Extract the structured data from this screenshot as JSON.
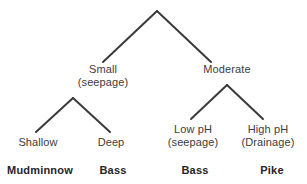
{
  "diagram": {
    "type": "decision-tree",
    "title": "",
    "background_color": "#ffffff",
    "edge_color": "#3a3a3a",
    "label_color": "#3c3c3c",
    "leaf_color": "#262626",
    "root": {
      "label": "",
      "children": [
        {
          "label_line1": "Small",
          "label_line2": "(seepage)",
          "children": [
            {
              "label_line1": "Shallow",
              "label_line2": "",
              "leaf": "Mudminnow"
            },
            {
              "label_line1": "Deep",
              "label_line2": "",
              "leaf": "Bass"
            }
          ]
        },
        {
          "label_line1": "Moderate",
          "label_line2": "",
          "children": [
            {
              "label_line1": "Low pH",
              "label_line2": "(seepage)",
              "leaf": "Bass"
            },
            {
              "label_line1": "High pH",
              "label_line2": "(Drainage)",
              "leaf": "Pike"
            }
          ]
        }
      ]
    },
    "nodes": {
      "small": {
        "line1": "Small",
        "line2": "(seepage)"
      },
      "moderate": {
        "line1": "Moderate",
        "line2": ""
      },
      "shallow": {
        "line1": "Shallow",
        "line2": ""
      },
      "deep": {
        "line1": "Deep",
        "line2": ""
      },
      "low_ph": {
        "line1": "Low pH",
        "line2": "(seepage)"
      },
      "high_ph": {
        "line1": "High pH",
        "line2": "(Drainage)"
      }
    },
    "leaves": {
      "mudminnow": "Mudminnow",
      "bass_left": "Bass",
      "bass_right": "Bass",
      "pike": "Pike"
    },
    "edges": [
      {
        "name": "root-to-small",
        "x1": 157,
        "y1": 11,
        "x2": 103,
        "y2": 62
      },
      {
        "name": "root-to-moderate",
        "x1": 157,
        "y1": 11,
        "x2": 211,
        "y2": 62
      },
      {
        "name": "small-to-shallow",
        "x1": 73,
        "y1": 98,
        "x2": 36,
        "y2": 132
      },
      {
        "name": "small-to-deep",
        "x1": 73,
        "y1": 98,
        "x2": 110,
        "y2": 132
      },
      {
        "name": "moderate-to-low-ph",
        "x1": 227,
        "y1": 85,
        "x2": 191,
        "y2": 119
      },
      {
        "name": "moderate-to-high-ph",
        "x1": 227,
        "y1": 85,
        "x2": 263,
        "y2": 119
      }
    ]
  }
}
